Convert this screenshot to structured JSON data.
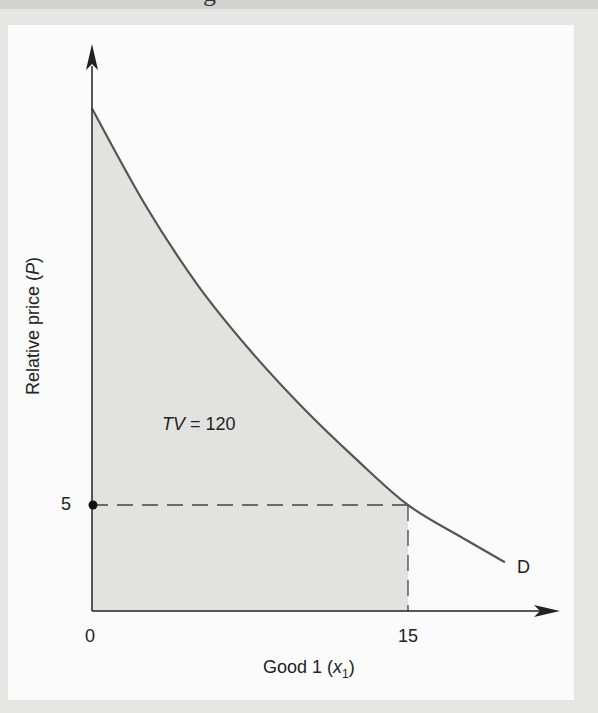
{
  "header_fragment": "g",
  "chart_data": {
    "type": "area",
    "title": "",
    "xlabel": "Good 1 (x1)",
    "xlabel_parts": {
      "prefix": "Good 1 (",
      "var": "x",
      "sub": "1",
      "suffix": ")"
    },
    "ylabel": "Relative price (P)",
    "ylabel_parts": {
      "prefix": "Relative price (",
      "var": "P",
      "suffix": ")"
    },
    "x_ticks": [
      {
        "value": 0,
        "label": "0"
      },
      {
        "value": 15,
        "label": "15"
      }
    ],
    "y_ticks": [
      {
        "value": 5,
        "label": "5"
      }
    ],
    "grid": false,
    "series": [
      {
        "name": "D",
        "kind": "demand_curve",
        "x": [
          0,
          2.5,
          5,
          7.5,
          10,
          12.5,
          15,
          17.5,
          19.6
        ],
        "y": [
          23.7,
          19.2,
          15.4,
          12.3,
          9.6,
          7.2,
          5.0,
          3.5,
          2.3
        ]
      }
    ],
    "shaded_area": {
      "from_x": 0,
      "to_x": 15,
      "under": "D",
      "label_var": "TV",
      "label_value": "120"
    },
    "reference_point": {
      "x": 15,
      "y": 5,
      "dashed_to_axes": true
    },
    "marked_point": {
      "x": 0,
      "y": 5
    },
    "annotations": [
      {
        "text": "TV = 120",
        "x": 4,
        "y": 8.8
      },
      {
        "text": "D",
        "x": 20.3,
        "y": 2.1
      }
    ],
    "xlim": [
      0,
      22
    ],
    "ylim": [
      0,
      26
    ],
    "colors": {
      "shade": "#e2e2e0",
      "curve": "#555555",
      "axis": "#222222"
    }
  },
  "labels": {
    "tv_var": "TV",
    "tv_eq": " = 120",
    "curve_label": "D",
    "tick_x0": "0",
    "tick_x15": "15",
    "tick_y5": "5"
  }
}
